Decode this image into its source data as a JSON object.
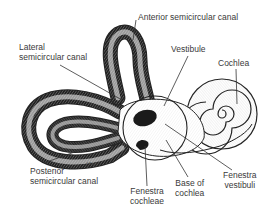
{
  "figure": {
    "colors": {
      "background": "#ffffff",
      "ink": "#222222",
      "label_text": "#3a3a3a",
      "dark_fill": "#1a1a1a",
      "shading": "#9a9a9a"
    },
    "labels": {
      "anterior": "Anterior semicircular canal",
      "lateral_line1": "Lateral",
      "lateral_line2": "semicircular canal",
      "vestibule": "Vestibule",
      "cochlea": "Cochlea",
      "posterior_line1": "Posterior",
      "posterior_line2": "semicircular canal",
      "fenestra_cochleae_line1": "Fenestra",
      "fenestra_cochleae_line2": "cochleae",
      "base_cochlea_line1": "Base of",
      "base_cochlea_line2": "cochlea",
      "fenestra_vestibuli_line1": "Fenestra",
      "fenestra_vestibuli_line2": "vestibuli"
    },
    "signature": "J.Todd"
  }
}
